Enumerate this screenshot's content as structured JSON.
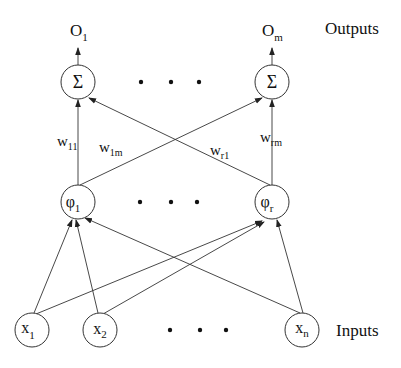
{
  "diagram": {
    "type": "neural-network-architecture",
    "layers": {
      "outputs": {
        "label": "Outputs",
        "nodes": [
          {
            "symbol": "Σ",
            "output_base": "O",
            "output_sub": "1"
          },
          {
            "symbol": "Σ",
            "output_base": "O",
            "output_sub": "m"
          }
        ],
        "ellipsis": "• • •"
      },
      "hidden": {
        "nodes": [
          {
            "symbol": "φ",
            "sub": "1"
          },
          {
            "symbol": "φ",
            "sub": "r"
          }
        ],
        "ellipsis": "• • •"
      },
      "inputs": {
        "label": "Inputs",
        "nodes": [
          {
            "symbol": "x",
            "sub": "1"
          },
          {
            "symbol": "x",
            "sub": "2"
          },
          {
            "symbol": "x",
            "sub": "n"
          }
        ],
        "ellipsis": "• • •"
      }
    },
    "weights": [
      {
        "base": "w",
        "sub": "11"
      },
      {
        "base": "w",
        "sub": "1m"
      },
      {
        "base": "w",
        "sub": "r1"
      },
      {
        "base": "w",
        "sub": "rm"
      }
    ]
  }
}
